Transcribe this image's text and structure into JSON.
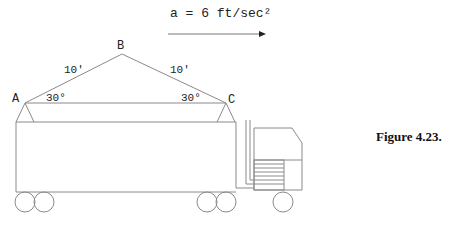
{
  "diagram": {
    "acceleration_label": "a = 6 ft/sec²",
    "points": {
      "A": "A",
      "B": "B",
      "C": "C"
    },
    "lengths": {
      "AB": "10'",
      "BC": "10'"
    },
    "angles": {
      "A": "30°",
      "C": "30°"
    },
    "caption": "Figure 4.23.",
    "colors": {
      "line": "#8a8a8a",
      "text": "#222222"
    }
  }
}
